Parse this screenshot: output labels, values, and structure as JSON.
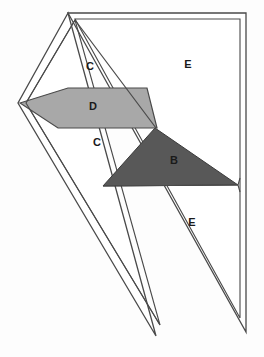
{
  "figure": {
    "canvas": {
      "width": 264,
      "height": 357
    },
    "background_color": "#fdfdfd",
    "stroke_color": "#4a4a4a",
    "stroke_width": 1.3,
    "fill_white": "#ffffff",
    "fill_light_gray": "#a8a8a8",
    "fill_dark_gray": "#585858"
  },
  "labels": {
    "c_upper": "C",
    "d_parallelogram": "D",
    "c_lower": "C",
    "b_triangle": "B",
    "e_upper": "E",
    "e_lower": "E"
  },
  "label_positions": {
    "c_upper": {
      "x": 90,
      "y": 67
    },
    "d_parallelogram": {
      "x": 93,
      "y": 107
    },
    "c_lower": {
      "x": 97,
      "y": 143
    },
    "b_triangle": {
      "x": 174,
      "y": 161
    },
    "e_upper": {
      "x": 188,
      "y": 65
    },
    "e_lower": {
      "x": 192,
      "y": 223
    }
  },
  "shapes": {
    "outer_big_triangle": "68,13 246,13 246,332",
    "inner_big_triangle": "75,19 240,19 240,318",
    "outer_fold_triangle": "68,13 18,103 156,336",
    "inner_fold_triangle": "75,20 26,103 160,325",
    "outer_left_flap": "68,13 18,103 103,186",
    "mid_horizontal_edge_y_top": 88,
    "mid_horizontal_edge_y_bottom": 128,
    "parallelogram_d": "20,103 68,88 147,88 157,128 58,128",
    "triangle_b": "155,128 238,185 103,186",
    "region_c_upper": "75,20 68,88 147,88",
    "region_c_lower": "58,128 155,128 103,186",
    "right_vertex_mid": {
      "x": 238,
      "y": 185
    },
    "right_edge_x_outer": 246,
    "right_edge_x_inner": 240,
    "bottom_vertex": {
      "x": 246,
      "y": 332
    }
  }
}
